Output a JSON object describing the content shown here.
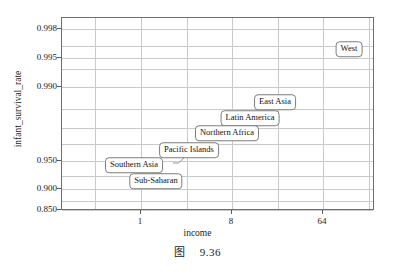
{
  "figure": {
    "caption_mark": "图",
    "caption_number": "9.36"
  },
  "chart_data": {
    "type": "scatter",
    "title": "",
    "xlabel": "income",
    "ylabel": "infant_survival_rate",
    "x_scale": "log2",
    "y_scale": "logit",
    "grid": true,
    "legend": "none",
    "xticks": [
      {
        "value": 1,
        "label": "1",
        "px": 140
      },
      {
        "value": 8,
        "label": "8",
        "px": 231
      },
      {
        "value": 64,
        "label": "64",
        "px": 322
      }
    ],
    "yticks": [
      {
        "value": 0.998,
        "label": "0.998",
        "px": 28
      },
      {
        "value": 0.995,
        "label": "0.995",
        "px": 57
      },
      {
        "value": 0.99,
        "label": "0.990",
        "px": 86
      },
      {
        "value": 0.95,
        "label": "0.950",
        "px": 160
      },
      {
        "value": 0.9,
        "label": "0.900",
        "px": 188
      },
      {
        "value": 0.85,
        "label": "0.850",
        "px": 209
      }
    ],
    "ygridlines_px": [
      28,
      45,
      57,
      68,
      86,
      108,
      127,
      143,
      160,
      175,
      188,
      200,
      209
    ],
    "xgridlines_px": [
      94,
      140,
      186,
      231,
      277,
      322,
      368
    ],
    "xlim": [
      0.35,
      170
    ],
    "ylim": [
      0.85,
      0.9985
    ],
    "points": [
      {
        "label": "West",
        "x": 85,
        "y": 0.9962,
        "px": 348,
        "py": 48
      },
      {
        "label": "East Asia",
        "x": 13,
        "y": 0.9885,
        "px": 274,
        "py": 101
      },
      {
        "label": "Latin America",
        "x": 9.5,
        "y": 0.9855,
        "px": 249,
        "py": 117
      },
      {
        "label": "Northern Africa",
        "x": 6.5,
        "y": 0.9815,
        "px": 226,
        "py": 132
      },
      {
        "label": "Pacific Islands",
        "x": 3.4,
        "y": 0.9755,
        "px": 188,
        "py": 149
      },
      {
        "label": "Southern Asia",
        "x": 1.7,
        "y": 0.9495,
        "px": 133,
        "py": 164
      },
      {
        "label": "Sub-Saharan",
        "x": 2.3,
        "y": 0.9245,
        "px": 155,
        "py": 180
      }
    ],
    "leader_lines": [
      {
        "from_label": "Southern Asia",
        "x1": 172,
        "y1": 162,
        "x2": 182,
        "y2": 157
      }
    ]
  }
}
